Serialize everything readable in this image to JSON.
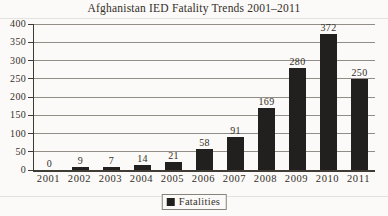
{
  "title": "Afghanistan IED Fatality Trends 2001–2011",
  "legend": {
    "label": "Fatalities"
  },
  "colors": {
    "background": "#fbfaf8",
    "bar": "#21201e",
    "gridline": "#928e87",
    "axis": "#403c35",
    "text": "#332f29",
    "legend_border": "#87837b"
  },
  "chart_data": {
    "type": "bar",
    "title": "Afghanistan IED Fatality Trends 2001–2011",
    "categories": [
      "2001",
      "2002",
      "2003",
      "2004",
      "2005",
      "2006",
      "2007",
      "2008",
      "2009",
      "2010",
      "2011"
    ],
    "values": [
      0,
      9,
      7,
      14,
      21,
      58,
      91,
      169,
      280,
      372,
      250
    ],
    "series_name": "Fatalities",
    "xlabel": "",
    "ylabel": "",
    "ylim": [
      0,
      400
    ],
    "yticks": [
      0,
      50,
      100,
      150,
      200,
      250,
      300,
      350,
      400
    ],
    "grid": "horizontal",
    "data_labels": true,
    "legend_position": "bottom"
  }
}
